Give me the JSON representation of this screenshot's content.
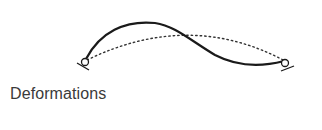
{
  "figure": {
    "caption": "Deformations",
    "colors": {
      "deformed_line": "#1a1a1a",
      "original_line": "#333333",
      "caption_text": "#3a3a3a",
      "background": "#ffffff"
    },
    "elements": {
      "deformed_shape": "solid curve (S-shaped deflection)",
      "original_shape": "dotted arc",
      "left_support": "pinned support",
      "right_support": "pinned support"
    }
  }
}
